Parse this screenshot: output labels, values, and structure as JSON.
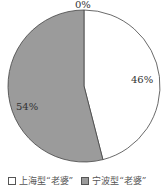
{
  "chart_data": {
    "type": "pie",
    "title": "",
    "categories": [
      "上海型“老婆”",
      "宁波型“老婆”",
      ""
    ],
    "values": [
      46,
      54,
      0
    ],
    "labels": [
      "46%",
      "54%",
      "0%"
    ],
    "colors": [
      "#ffffff",
      "#9b9b9b"
    ],
    "legend_position": "bottom"
  },
  "legend": {
    "items": [
      {
        "label": "上海型“老婆”",
        "color": "#ffffff"
      },
      {
        "label": "宁波型“老婆”",
        "color": "#9b9b9b"
      }
    ]
  },
  "slice_labels": {
    "top": "0%",
    "right": "46%",
    "left": "54%"
  }
}
